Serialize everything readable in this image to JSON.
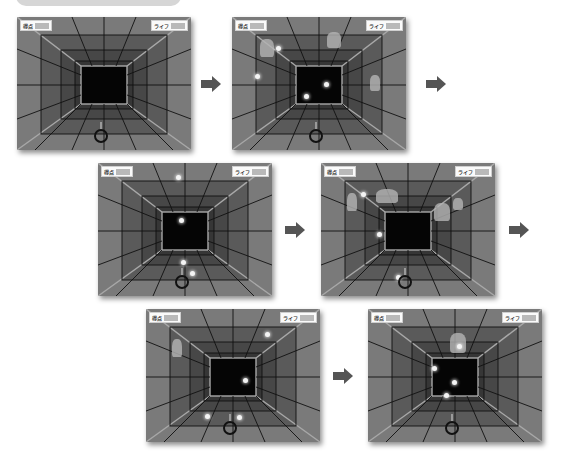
{
  "hud": {
    "score_label": "得点",
    "life_label": "ライフ",
    "score_value": "",
    "life_value": ""
  },
  "colors": {
    "wall_outer": "#7a7a7a",
    "wall_mid": "#5e5e5e",
    "wall_inner": "#3c3c3c",
    "core": "#050505",
    "grid_line": "#111111",
    "edge_line": "#a8a8a8",
    "orb": "#f4f4f4",
    "arrow": "#555555"
  },
  "sequence": [
    {
      "step": 1,
      "orbs": [],
      "creatures": []
    },
    {
      "step": 2,
      "orbs": [
        [
          46,
          31
        ],
        [
          25,
          59
        ],
        [
          94,
          67
        ],
        [
          74,
          79
        ]
      ],
      "creatures": [
        "bird-left",
        "ghost-top",
        "figure-right"
      ]
    },
    {
      "step": 3,
      "orbs": [
        [
          80,
          14
        ],
        [
          83,
          57
        ],
        [
          85,
          99
        ],
        [
          94,
          110
        ]
      ],
      "creatures": []
    },
    {
      "step": 4,
      "orbs": [
        [
          42,
          31
        ],
        [
          58,
          71
        ],
        [
          77,
          114
        ]
      ],
      "creatures": [
        "figure-left",
        "bat-top",
        "swan-right",
        "sparkle-right"
      ]
    },
    {
      "step": 5,
      "orbs": [
        [
          121,
          25
        ],
        [
          99,
          71
        ],
        [
          61,
          107
        ],
        [
          93,
          108
        ]
      ],
      "creatures": [
        "figure-left"
      ]
    },
    {
      "step": 6,
      "orbs": [
        [
          91,
          37
        ],
        [
          66,
          59
        ],
        [
          86,
          73
        ],
        [
          78,
          86
        ]
      ],
      "creatures": [
        "dog-top"
      ]
    }
  ]
}
